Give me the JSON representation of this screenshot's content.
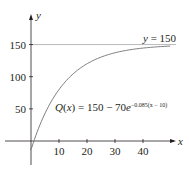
{
  "chart_data": {
    "type": "line",
    "title": "",
    "xlabel": "x",
    "ylabel": "y",
    "xlim": [
      -5,
      50
    ],
    "ylim": [
      -30,
      185
    ],
    "x_ticks": [
      10,
      20,
      30,
      40
    ],
    "y_ticks": [
      50,
      100,
      150
    ],
    "grid": false,
    "series": [
      {
        "name": "Q(x) = 150 − 70e^{−0.085(x − 10)}",
        "formula": "150 - 70*exp(-0.085*(x-10))",
        "x": [
          0,
          5,
          10,
          15,
          20,
          25,
          30,
          35,
          40,
          45,
          50
        ],
        "values": [
          -13.8,
          39.7,
          80.0,
          104.3,
          120.3,
          130.7,
          137.4,
          141.7,
          144.6,
          146.4,
          147.7
        ]
      },
      {
        "name": "y = 150",
        "type": "asymptote",
        "value": 150
      }
    ],
    "annotations": [
      {
        "text": "y = 150",
        "x": 43,
        "y": 155
      },
      {
        "text": "Q(x) = 150 − 70e^{−0.085(x − 10)}",
        "x": 24,
        "y": 65
      }
    ]
  },
  "labels": {
    "x_axis": "x",
    "y_axis": "y",
    "x_ticks": [
      "10",
      "20",
      "30",
      "40"
    ],
    "y_ticks": [
      "150",
      "100",
      "50"
    ],
    "asymptote": "y = 150",
    "formula_main": "Q(x) = 150 − 70e",
    "formula_exp": "−0.085(x − 10)"
  },
  "colors": {
    "axis": "#231f20",
    "curve": "#6d6e71",
    "asymptote": "#a7a9ac",
    "text": "#231f20"
  }
}
